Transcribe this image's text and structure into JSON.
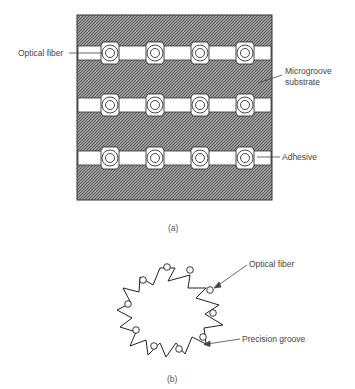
{
  "figure_a": {
    "caption": "(a)",
    "labels": {
      "optical_fiber": "Optical fiber",
      "microgroove_line1": "Microgroove",
      "microgroove_line2": "substrate",
      "adhesive": "Adhesive"
    },
    "rows": 3,
    "fibers_per_row": 4,
    "substrate_color": "#8a8a8a",
    "adhesive_color": "#ffffff"
  },
  "figure_b": {
    "caption": "(b)",
    "labels": {
      "optical_fiber": "Optical fiber",
      "precision_groove": "Precision groove"
    },
    "grooves": 12
  }
}
